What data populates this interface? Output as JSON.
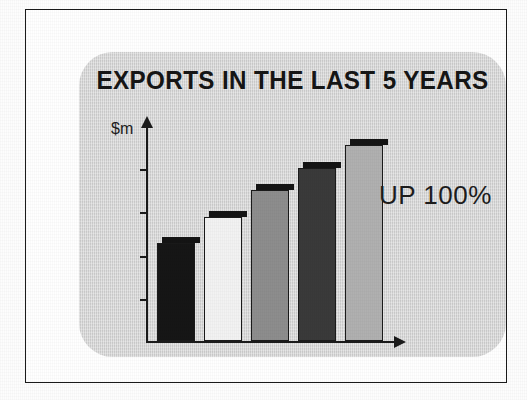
{
  "page": {
    "background_color": "#fdfdfd",
    "frame_border_color": "#1b1b1b",
    "panel_color": "#d8d8d8"
  },
  "slide": {
    "title": "EXPORTS IN THE LAST 5 YEARS",
    "callout": "UP 100%",
    "y_axis_label": "$m"
  },
  "chart_data": {
    "type": "bar",
    "title": "EXPORTS IN THE LAST 5 YEARS",
    "xlabel": "",
    "ylabel": "$m",
    "categories": [
      "Year 1",
      "Year 2",
      "Year 3",
      "Year 4",
      "Year 5"
    ],
    "values": [
      50,
      63,
      77,
      88,
      100
    ],
    "ylim": [
      0,
      110
    ],
    "grid": false,
    "legend": false,
    "annotations": [
      "UP 100%"
    ],
    "tick_count": 4,
    "axis_style": "arrow-headed",
    "bars": [
      {
        "label": "Year 1",
        "value": 50,
        "fill": "#161616",
        "name": "bar-1"
      },
      {
        "label": "Year 2",
        "value": 63,
        "fill": "#f2f2f2",
        "name": "bar-2"
      },
      {
        "label": "Year 3",
        "value": 77,
        "fill": "#8d8d8d",
        "name": "bar-3"
      },
      {
        "label": "Year 4",
        "value": 88,
        "fill": "#3a3a3a",
        "name": "bar-4"
      },
      {
        "label": "Year 5",
        "value": 100,
        "fill": "#b0b0b0",
        "name": "bar-5"
      }
    ]
  },
  "colors": {
    "ink": "#1b1b1b",
    "panel": "#d8d8d8",
    "bar_black": "#161616",
    "bar_white": "#f2f2f2",
    "bar_mid_grey": "#8d8d8d",
    "bar_dark_grey": "#3a3a3a",
    "bar_light_grey": "#b0b0b0"
  }
}
